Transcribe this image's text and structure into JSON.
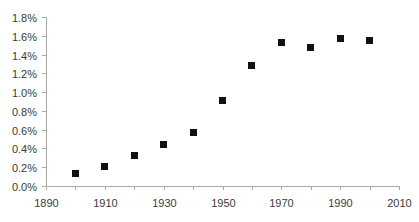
{
  "chart_data": {
    "type": "scatter",
    "title": "",
    "subtitle": "",
    "xlabel": "",
    "ylabel": "",
    "xlim": [
      1890,
      2010
    ],
    "ylim": [
      0.0,
      1.8
    ],
    "grid": false,
    "legend": false,
    "legend_position": "none",
    "marker": "square",
    "marker_color": "#111111",
    "axis_color": "#aaaaaa",
    "label_color": "#3a3a3a",
    "x_tick_labels": [
      "1890",
      "1910",
      "1930",
      "1950",
      "1970",
      "1990",
      "2010"
    ],
    "x_ticks": [
      1890,
      1910,
      1930,
      1950,
      1970,
      1990,
      2010
    ],
    "x_minor_ticks": [
      1900,
      1920,
      1940,
      1960,
      1980,
      2000
    ],
    "y_tick_labels": [
      "0.0%",
      "0.2%",
      "0.4%",
      "0.6%",
      "0.8%",
      "1.0%",
      "1.2%",
      "1.4%",
      "1.6%",
      "1.8%"
    ],
    "y_ticks": [
      0.0,
      0.2,
      0.4,
      0.6,
      0.8,
      1.0,
      1.2,
      1.4,
      1.6,
      1.8
    ],
    "x": [
      1900,
      1910,
      1920,
      1930,
      1940,
      1950,
      1960,
      1970,
      1980,
      1990,
      2000
    ],
    "values": [
      0.13,
      0.21,
      0.32,
      0.44,
      0.57,
      0.91,
      1.28,
      1.53,
      1.47,
      1.57,
      1.55
    ],
    "points": [
      {
        "x": 1900,
        "y": 0.13
      },
      {
        "x": 1910,
        "y": 0.21
      },
      {
        "x": 1920,
        "y": 0.32
      },
      {
        "x": 1930,
        "y": 0.44
      },
      {
        "x": 1940,
        "y": 0.57
      },
      {
        "x": 1950,
        "y": 0.91
      },
      {
        "x": 1960,
        "y": 1.28
      },
      {
        "x": 1970,
        "y": 1.53
      },
      {
        "x": 1980,
        "y": 1.47
      },
      {
        "x": 1990,
        "y": 1.57
      },
      {
        "x": 2000,
        "y": 1.55
      }
    ],
    "series": [
      {
        "name": "",
        "x": [
          1900,
          1910,
          1920,
          1930,
          1940,
          1950,
          1960,
          1970,
          1980,
          1990,
          2000
        ],
        "values": [
          0.13,
          0.21,
          0.32,
          0.44,
          0.57,
          0.91,
          1.28,
          1.53,
          1.47,
          1.57,
          1.55
        ]
      }
    ]
  },
  "layout": {
    "plot_left": 46,
    "plot_right": 399,
    "plot_top": 17,
    "plot_bottom": 186,
    "marker_size": 7,
    "x_tick_length": 4,
    "y_tick_length": 4,
    "y_label_offset": 5,
    "x_label_offset": 17
  }
}
